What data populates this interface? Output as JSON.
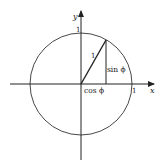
{
  "diagram": {
    "type": "unit-circle",
    "labels": {
      "y_axis": "y",
      "x_axis": "x",
      "y_tick": "1",
      "x_tick": "1",
      "hypotenuse": "1",
      "sine": "sin ϕ",
      "cosine": "cos ϕ"
    },
    "colors": {
      "stroke": "#222222",
      "background": "#ffffff"
    }
  }
}
